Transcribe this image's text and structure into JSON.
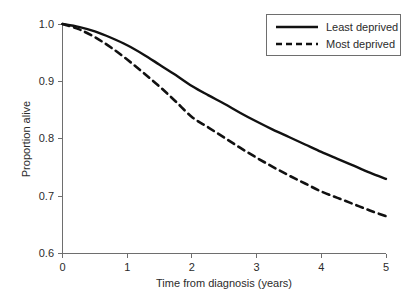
{
  "chart_data": {
    "type": "line",
    "title": "",
    "xlabel": "Time from diagnosis (years)",
    "ylabel": "Proportion alive",
    "xlim": [
      0,
      5
    ],
    "ylim": [
      0.6,
      1.0
    ],
    "xticks": [
      "0",
      "1",
      "2",
      "3",
      "4",
      "5"
    ],
    "yticks": [
      "0.6",
      "0.7",
      "0.8",
      "0.9",
      "1.0"
    ],
    "grid": false,
    "legend_position": "upper-right",
    "x": [
      0,
      0.25,
      0.5,
      0.75,
      1,
      1.25,
      1.5,
      1.75,
      2,
      2.25,
      2.5,
      2.75,
      3,
      3.25,
      3.5,
      3.75,
      4,
      4.25,
      4.5,
      4.75,
      5
    ],
    "series": [
      {
        "name": "Least deprived",
        "style": "solid",
        "color": "#111111",
        "values": [
          1.0,
          0.995,
          0.987,
          0.976,
          0.963,
          0.947,
          0.929,
          0.911,
          0.892,
          0.876,
          0.861,
          0.845,
          0.83,
          0.816,
          0.803,
          0.79,
          0.777,
          0.765,
          0.753,
          0.741,
          0.73
        ]
      },
      {
        "name": "Most deprived",
        "style": "dashed",
        "color": "#111111",
        "values": [
          1.0,
          0.991,
          0.977,
          0.959,
          0.938,
          0.915,
          0.891,
          0.865,
          0.838,
          0.82,
          0.802,
          0.784,
          0.767,
          0.751,
          0.736,
          0.722,
          0.708,
          0.697,
          0.686,
          0.675,
          0.665
        ]
      }
    ],
    "annotations": []
  },
  "legend": {
    "entries": [
      {
        "label": "Least deprived"
      },
      {
        "label": "Most deprived"
      }
    ]
  },
  "axes": {
    "x_title": "Time from diagnosis (years)",
    "y_title": "Proportion alive"
  },
  "colors": {
    "line": "#111111",
    "axis": "#6e6e6e",
    "text": "#2b2b2b",
    "background": "#ffffff"
  }
}
